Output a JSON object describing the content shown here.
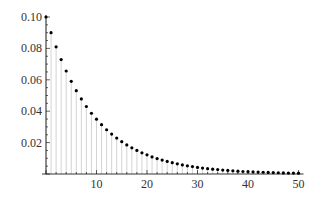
{
  "chart_data": {
    "type": "scatter",
    "subtype": "discrete-stem",
    "title": "",
    "xlabel": "",
    "ylabel": "",
    "xlim": [
      0,
      50
    ],
    "ylim": [
      0,
      0.1
    ],
    "x_ticks": [
      10,
      20,
      30,
      40,
      50
    ],
    "y_ticks": [
      0.02,
      0.04,
      0.06,
      0.08,
      0.1
    ],
    "x_tick_labels": [
      "10",
      "20",
      "30",
      "40",
      "50"
    ],
    "y_tick_labels": [
      "0.02",
      "0.04",
      "0.06",
      "0.08",
      "0.10"
    ],
    "grid": false,
    "legend": null,
    "x": [
      0,
      1,
      2,
      3,
      4,
      5,
      6,
      7,
      8,
      9,
      10,
      11,
      12,
      13,
      14,
      15,
      16,
      17,
      18,
      19,
      20,
      21,
      22,
      23,
      24,
      25,
      26,
      27,
      28,
      29,
      30,
      31,
      32,
      33,
      34,
      35,
      36,
      37,
      38,
      39,
      40,
      41,
      42,
      43,
      44,
      45,
      46,
      47,
      48,
      49,
      50
    ],
    "values": [
      0.1,
      0.09,
      0.081,
      0.0729,
      0.0656,
      0.059,
      0.0531,
      0.0478,
      0.043,
      0.0387,
      0.0349,
      0.0314,
      0.0282,
      0.0254,
      0.0229,
      0.0206,
      0.0185,
      0.0167,
      0.015,
      0.0135,
      0.0122,
      0.0109,
      0.0098,
      0.0089,
      0.008,
      0.0072,
      0.0065,
      0.0058,
      0.0052,
      0.0047,
      0.0042,
      0.0038,
      0.0034,
      0.0031,
      0.0028,
      0.0025,
      0.0023,
      0.002,
      0.0018,
      0.0016,
      0.0015,
      0.0013,
      0.0012,
      0.0011,
      0.001,
      0.0009,
      0.0008,
      0.0007,
      0.0006,
      0.0006,
      0.0005
    ],
    "colors": {
      "points": "#000000",
      "stems": "#c8c8c8",
      "axes": "#000000"
    }
  }
}
